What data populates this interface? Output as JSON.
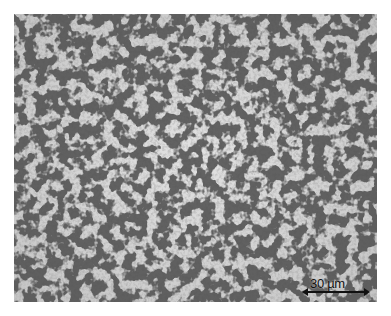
{
  "image": {
    "description": "Optical micrograph of ferrite-pearlite steel microstructure",
    "background_color": "#ffffff",
    "matrix_color": "#d2d2d2",
    "phase_color": "#555555"
  },
  "scale_bar": {
    "label": "30 µm",
    "color": "#111111"
  }
}
